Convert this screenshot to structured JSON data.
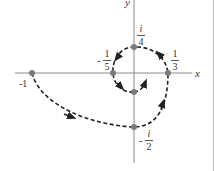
{
  "figure": {
    "axes": {
      "x_label": "x",
      "y_label": "y",
      "color": "#8a8a8a"
    },
    "curve": {
      "style": "dashed spiral",
      "color": "#222222",
      "direction": "from -1 through -i/2, 1/3, i/4, -1/5 spiraling inward toward origin"
    },
    "points": [
      {
        "id": "minus-one",
        "label": "-1",
        "value": "-1"
      },
      {
        "id": "minus-i-half",
        "label_sign": "-",
        "label_num": "i",
        "label_den": "2",
        "value": "-i/2"
      },
      {
        "id": "one-third",
        "label_num": "1",
        "label_den": "3",
        "value": "1/3"
      },
      {
        "id": "i-quarter",
        "label_num": "i",
        "label_den": "4",
        "value": "i/4"
      },
      {
        "id": "minus-one-fifth",
        "label_sign": "-",
        "label_num": "1",
        "label_den": "5",
        "value": "-1/5"
      }
    ],
    "point_color": "#7a7a7a"
  }
}
